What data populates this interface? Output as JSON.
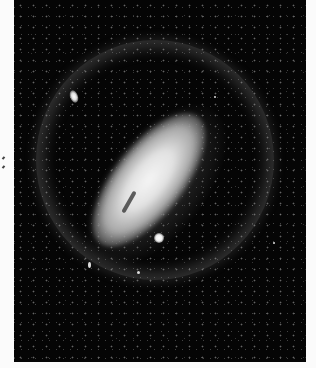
{
  "image": {
    "description": "Black-and-white astronomical photograph of a spiral galaxy seen at an oblique angle, surrounded by a faint circular halo ring, with two bright companion objects and a dense star field",
    "subjects": [
      "spiral galaxy core",
      "circular halo ring",
      "upper-left companion galaxy",
      "bright compact companion below galaxy",
      "star field"
    ],
    "colors": {
      "background": "#050505",
      "margin": "#fbfbfb",
      "galaxy_core": "#f5f5f5"
    }
  }
}
